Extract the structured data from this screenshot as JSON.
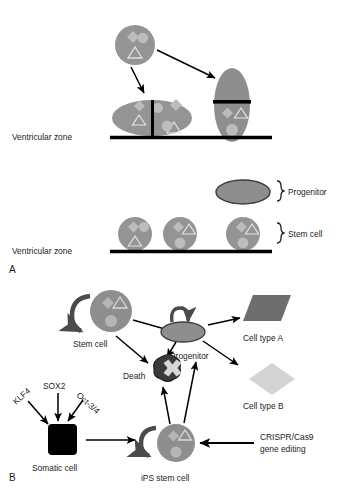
{
  "figure": {
    "panels": [
      {
        "id": "A",
        "label": "A"
      },
      {
        "id": "B",
        "label": "B"
      }
    ]
  },
  "panel_a": {
    "label": "A",
    "zone_label_top": "Ventricular zone",
    "zone_label_bottom": "Ventricular zone",
    "legend": [
      {
        "name": "progenitor",
        "label": "Progenitor"
      },
      {
        "name": "stem-cell",
        "label": "Stem cell"
      }
    ],
    "cells": {
      "parent_stem_cell": "stem cell",
      "horizontal_dividing_cell": "symmetric division",
      "vertical_dividing_cell": "asymmetric division"
    }
  },
  "panel_b": {
    "label": "B",
    "nodes": [
      {
        "name": "stem-cell",
        "label": "Stem cell"
      },
      {
        "name": "progenitor",
        "label": "Progenitor"
      },
      {
        "name": "death",
        "label": "Death"
      },
      {
        "name": "cell-type-a",
        "label": "Cell type A"
      },
      {
        "name": "cell-type-b",
        "label": "Cell type B"
      },
      {
        "name": "somatic-cell",
        "label": "Somatic cell"
      },
      {
        "name": "ips-stem-cell",
        "label": "iPS stem cell"
      }
    ],
    "factors": [
      {
        "name": "klf4",
        "label": "KLF4"
      },
      {
        "name": "sox2",
        "label": "SOX2"
      },
      {
        "name": "oct34",
        "label": "Oct-3/4"
      }
    ],
    "editing": {
      "line1": "CRISPR/Cas9",
      "line2": "gene editing"
    }
  },
  "colors": {
    "cell_body": "#949494",
    "cell_body_dark": "#8c8c8c",
    "inner_shape_light": "#bfbfbf",
    "inner_shape_mid": "#b0b0b0",
    "cell_type_a": "#6e6e6e",
    "cell_type_b": "#d4d4d4",
    "somatic_cell": "#000000",
    "line": "#000000",
    "death_blob": "#3a3a3a",
    "arrow_gray": "#4a4a4a",
    "background": "#ffffff"
  }
}
